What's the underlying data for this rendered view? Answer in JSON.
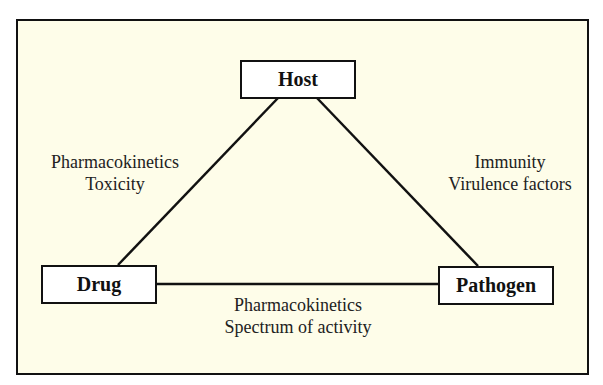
{
  "diagram": {
    "type": "triangle-relationship",
    "nodes": {
      "host": {
        "label": "Host"
      },
      "drug": {
        "label": "Drug"
      },
      "pathogen": {
        "label": "Pathogen"
      }
    },
    "edges": {
      "host_drug": {
        "line1": "Pharmacokinetics",
        "line2": "Toxicity"
      },
      "host_pathogen": {
        "line1": "Immunity",
        "line2": "Virulence factors"
      },
      "drug_pathogen": {
        "line1": "Pharmacokinetics",
        "line2": "Spectrum of activity"
      }
    },
    "colors": {
      "background": "#fefde9",
      "node_fill": "#ffffff",
      "stroke": "#111111",
      "text": "#222222"
    }
  }
}
